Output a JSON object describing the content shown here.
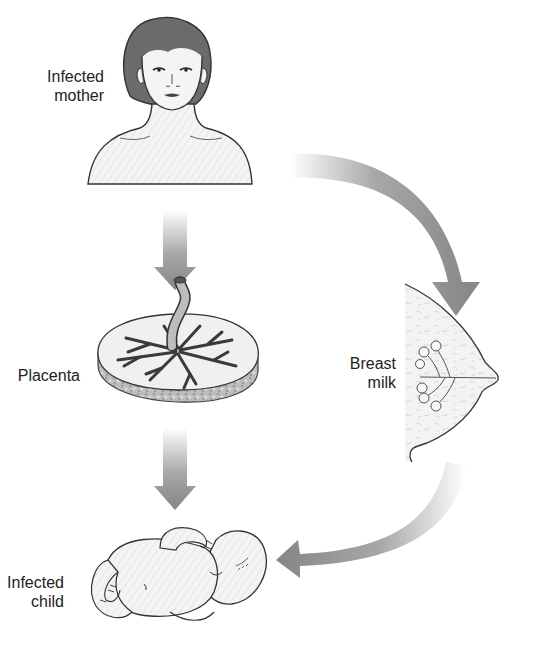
{
  "diagram": {
    "nodes": [
      {
        "id": "mother",
        "label_line1": "Infected",
        "label_line2": "mother"
      },
      {
        "id": "placenta",
        "label": "Placenta"
      },
      {
        "id": "breast",
        "label_line1": "Breast",
        "label_line2": "milk"
      },
      {
        "id": "child",
        "label_line1": "Infected",
        "label_line2": "child"
      }
    ],
    "edges": [
      {
        "from": "mother",
        "to": "placenta",
        "style": "straight-down-arrow"
      },
      {
        "from": "placenta",
        "to": "child",
        "style": "straight-down-arrow"
      },
      {
        "from": "mother",
        "to": "breast",
        "style": "curved-arrow"
      },
      {
        "from": "breast",
        "to": "child",
        "style": "curved-arrow"
      }
    ],
    "colors": {
      "arrow": "#8a8a8a",
      "hair": "#6b6b6b",
      "skin": "#f2f2f2",
      "outline": "#333333",
      "text": "#222222"
    }
  }
}
